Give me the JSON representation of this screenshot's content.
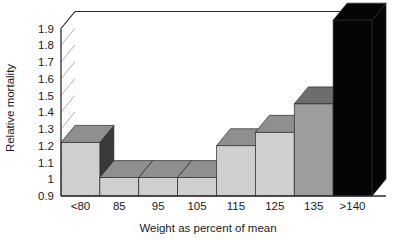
{
  "chart_data": {
    "type": "bar",
    "title": "",
    "xlabel": "Weight as percent of mean",
    "ylabel": "Relative mortality",
    "categories": [
      "<80",
      "85",
      "95",
      "105",
      "115",
      "125",
      "135",
      ">140"
    ],
    "values": [
      1.22,
      1.01,
      1.01,
      1.01,
      1.2,
      1.28,
      1.45,
      1.95
    ],
    "value_notes": ">140 bar is clipped at the top of the plot area",
    "ylim": [
      0.9,
      1.9
    ],
    "ytick_labels": [
      "0.9",
      "1",
      "1.1",
      "1.2",
      "1.3",
      "1.4",
      "1.5",
      "1.6",
      "1.7",
      "1.8",
      "1.9"
    ],
    "ytick_values": [
      0.9,
      1.0,
      1.1,
      1.2,
      1.3,
      1.4,
      1.5,
      1.6,
      1.7,
      1.8,
      1.9
    ],
    "grid": true,
    "legend": null,
    "style": "3d-bars",
    "bar_colors": [
      "#cfcfcf",
      "#cfcfcf",
      "#cfcfcf",
      "#cfcfcf",
      "#cfcfcf",
      "#cfcfcf",
      "#9d9d9d",
      "#050505"
    ],
    "bar_top_colors": [
      "#8f8f8f",
      "#8f8f8f",
      "#8f8f8f",
      "#8f8f8f",
      "#8f8f8f",
      "#8f8f8f",
      "#6d6d6d",
      "#050505"
    ],
    "bar_side_colors": [
      "#3a3a3a",
      "#8f8f8f",
      "#8f8f8f",
      "#8f8f8f",
      "#8f8f8f",
      "#8f8f8f",
      "#3d3d3d",
      "#050505"
    ],
    "colors": {
      "background": "#ffffff",
      "axis": "#2b2b2b",
      "grid": "#9a9a9a",
      "text": "#1b1b1b"
    }
  }
}
